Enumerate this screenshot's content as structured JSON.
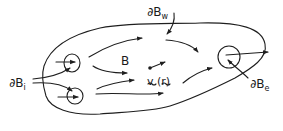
{
  "diagram": {
    "labels": {
      "inlet": {
        "symbol": "∂B",
        "subscript": "i"
      },
      "wall": {
        "symbol": "∂B",
        "subscript": "w"
      },
      "exit": {
        "symbol": "∂B",
        "subscript": "e"
      },
      "domain": "B",
      "velocity": "v (r)"
    },
    "colors": {
      "stroke": "#1e1e1e",
      "background": "#ffffff"
    }
  }
}
